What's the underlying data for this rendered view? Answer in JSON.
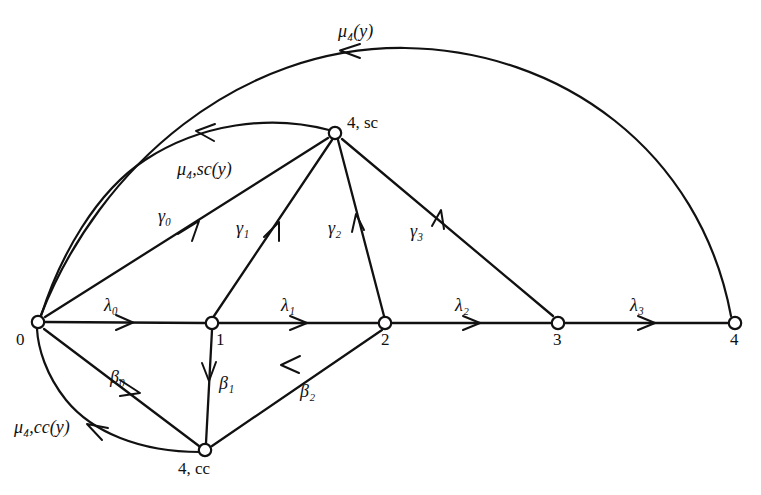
{
  "figure": {
    "type": "state-transition-diagram",
    "background_color": "#ffffff",
    "stroke_color": "#111111"
  },
  "nodes": [
    {
      "id": "n0",
      "label": "0",
      "label_html": "0",
      "x": 38,
      "y": 322,
      "label_x": 16,
      "label_y": 331
    },
    {
      "id": "n1",
      "label": "1",
      "label_html": "1",
      "x": 212,
      "y": 323,
      "label_x": 216,
      "label_y": 331
    },
    {
      "id": "n2",
      "label": "2",
      "label_html": "2",
      "x": 385,
      "y": 323,
      "label_x": 381,
      "label_y": 331
    },
    {
      "id": "n3",
      "label": "3",
      "label_html": "3",
      "x": 558,
      "y": 323,
      "label_x": 553,
      "label_y": 331
    },
    {
      "id": "n4",
      "label": "4",
      "label_html": "4",
      "x": 735,
      "y": 323,
      "label_x": 730,
      "label_y": 331
    },
    {
      "id": "n4sc",
      "label": "4, sc",
      "label_html": "4, sc",
      "x": 335,
      "y": 133,
      "label_x": 347,
      "label_y": 114
    },
    {
      "id": "n4cc",
      "label": "4, cc",
      "label_html": "4, cc",
      "x": 205,
      "y": 450,
      "label_x": 178,
      "label_y": 460
    }
  ],
  "edges": [
    {
      "id": "e-l0",
      "label": "λ₀",
      "from": "n0",
      "to": "n1",
      "label_x": 104,
      "label_y": 296
    },
    {
      "id": "e-l1",
      "label": "λ₁",
      "from": "n1",
      "to": "n2",
      "label_x": 281,
      "label_y": 296
    },
    {
      "id": "e-l2",
      "label": "λ₂",
      "from": "n2",
      "to": "n3",
      "label_x": 455,
      "label_y": 296
    },
    {
      "id": "e-l3",
      "label": "λ₃",
      "from": "n3",
      "to": "n4",
      "label_x": 630,
      "label_y": 296
    },
    {
      "id": "e-g0",
      "label": "γ₀",
      "from": "n0",
      "to": "n4sc",
      "label_x": 158,
      "label_y": 207
    },
    {
      "id": "e-g1",
      "label": "γ₁",
      "from": "n1",
      "to": "n4sc",
      "label_x": 236,
      "label_y": 219
    },
    {
      "id": "e-g2",
      "label": "γ₂",
      "from": "n2",
      "to": "n4sc",
      "label_x": 328,
      "label_y": 219
    },
    {
      "id": "e-g3",
      "label": "γ₃",
      "from": "n3",
      "to": "n4sc",
      "label_x": 410,
      "label_y": 222
    },
    {
      "id": "e-b0",
      "label": "β₀",
      "from": "n0",
      "to": "n4cc",
      "label_x": 110,
      "label_y": 368
    },
    {
      "id": "e-b1",
      "label": "β₁",
      "from": "n1",
      "to": "n4cc",
      "label_x": 219,
      "label_y": 374
    },
    {
      "id": "e-b2",
      "label": "β₂",
      "from": "n2",
      "to": "n4cc",
      "label_x": 300,
      "label_y": 382
    },
    {
      "id": "e-mu4",
      "label": "μ₄(y)",
      "from": "n4",
      "to": "n0",
      "label_x": 338,
      "label_y": 22
    },
    {
      "id": "e-mu4sc",
      "label": "μ₄,sc(y)",
      "from": "n4sc",
      "to": "n0",
      "label_x": 177,
      "label_y": 160
    },
    {
      "id": "e-mu4cc",
      "label": "μ₄,cc(y)",
      "from": "n4cc",
      "to": "n0",
      "label_x": 14,
      "label_y": 418
    }
  ]
}
